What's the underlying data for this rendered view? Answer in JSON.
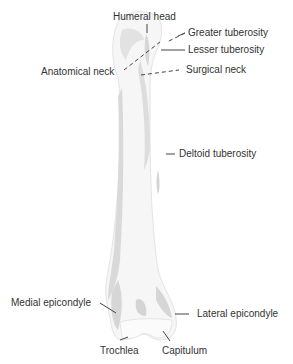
{
  "diagram": {
    "labels": {
      "humeral_head": "Humeral head",
      "greater_tuberosity": "Greater tuberosity",
      "lesser_tuberosity": "Lesser tuberosity",
      "anatomical_neck": "Anatomical neck",
      "surgical_neck": "Surgical neck",
      "deltoid_tuberosity": "Deltoid tuberosity",
      "medial_epicondyle": "Medial epicondyle",
      "lateral_epicondyle": "Lateral epicondyle",
      "trochlea": "Trochlea",
      "capitulum": "Capitulum"
    },
    "colors": {
      "bone_fill": "#f4f4f4",
      "bone_shade": "#d8d8d8",
      "bone_outline": "#e6e6e6",
      "leader_line": "#444444",
      "text": "#333333"
    }
  }
}
